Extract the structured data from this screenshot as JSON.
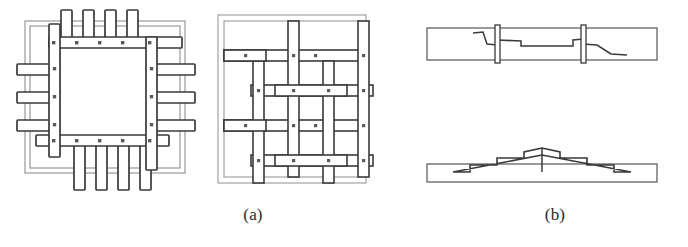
{
  "figure": {
    "background_color": "#ffffff",
    "ink_color": "#3a3a3a",
    "light_ink_color": "#8c8c8c",
    "fill_color": "#ffffff",
    "width": 688,
    "height": 247
  },
  "captions": {
    "a": "(a)",
    "b": "(b)"
  },
  "panel_a": {
    "label": "(a)",
    "description": "Plan views of interlocking timber frame assemblies",
    "left_diagram": {
      "name": "projecting-frame-plan",
      "description": "Square timber frame with members projecting beyond the corners, bolted at crossings",
      "outer_frame_lines": 2,
      "top_projecting_members": 4,
      "bottom_projecting_members": 4,
      "left_projecting_members": 3,
      "right_projecting_members": 3,
      "bolt_markers_top_rail": 5,
      "bolt_markers_bottom_rail": 5,
      "bolt_markers_left_stile": 4,
      "bolt_markers_right_stile": 4
    },
    "right_diagram": {
      "name": "woven-lattice-plan",
      "description": "Basket-weave lattice of horizontal and vertical timber members within a border frame",
      "border_frame_lines": 2,
      "vertical_members": 4,
      "horizontal_members": 4,
      "bolt_markers": 16
    }
  },
  "panel_b": {
    "label": "(b)",
    "description": "Elevation views of longitudinal scarf joints in timber beams",
    "upper_beam": {
      "name": "keyed-scarf-joint-elevation",
      "description": "Beam with a stepped scarf splice secured by two transverse keys",
      "keys": 2
    },
    "lower_beam": {
      "name": "stepped-scarf-joint-elevation",
      "description": "Beam with a symmetric saw-tooth stepped scarf joint meeting at mid-span",
      "steps_per_side": 3
    }
  }
}
